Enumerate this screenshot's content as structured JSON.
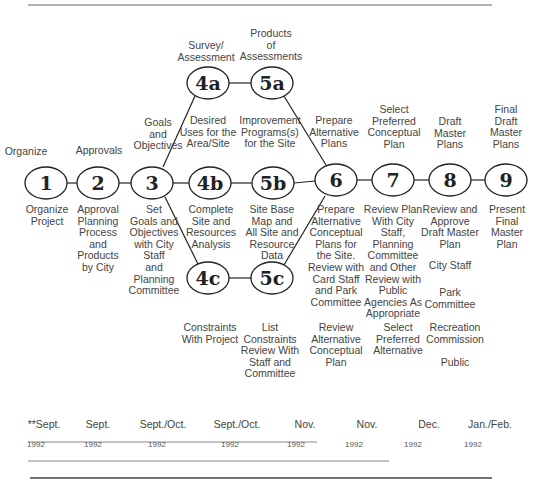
{
  "nodes": [
    {
      "id": "1",
      "x": 46,
      "y": 183
    },
    {
      "id": "2",
      "x": 98,
      "y": 183
    },
    {
      "id": "3",
      "x": 152,
      "y": 183
    },
    {
      "id": "4a",
      "x": 208,
      "y": 83
    },
    {
      "id": "4b",
      "x": 210,
      "y": 183
    },
    {
      "id": "4c",
      "x": 208,
      "y": 278
    },
    {
      "id": "5a",
      "x": 272,
      "y": 83
    },
    {
      "id": "5b",
      "x": 273,
      "y": 183
    },
    {
      "id": "5c",
      "x": 272,
      "y": 278
    },
    {
      "id": "6",
      "x": 336,
      "y": 180
    },
    {
      "id": "7",
      "x": 393,
      "y": 180
    },
    {
      "id": "8",
      "x": 450,
      "y": 180
    },
    {
      "id": "9",
      "x": 506,
      "y": 180
    }
  ],
  "labels_above": {
    "n1": "Organize",
    "n2": "Approvals",
    "n3": "Goals\nand\nObjectives",
    "n4a": "Survey/\nAssessment",
    "n5a": "Products\nof\nAssessments",
    "n4b": "Desired\nUses for the\nArea/Site",
    "n5b": "Improvement\nPrograms(s)\nfor the Site",
    "n6": "Prepare\nAlternative\nPlans",
    "n7": "Select\nPreferred\nConceptual\nPlan",
    "n8": "Draft\nMaster\nPlans",
    "n9": "Final\nDraft\nMaster\nPlans"
  },
  "labels_below": {
    "n1": "Organize\nProject",
    "n2": "Approval\nPlanning\nProcess\nand\nProducts\nby City",
    "n3": "Set\nGoals and\nObjectives\nwith City\nStaff\nand\nPlanning\nCommittee",
    "n4b": "Complete\nSite and\nResources\nAnalysis",
    "n5b": "Site Base\nMap and\nAll Site and\nResource\nData",
    "n6": "Prepare\nAlternative\nConceptual\nPlans for\nthe Site.\nReview with\nCard Staff\nand Park\nCommittee",
    "n7": "Review Plan\nWith City\nStaff,\nPlanning\nCommittee\nand Other\nReview with\nPublic\nAgencies As\nAppropriate",
    "n8": "Review and\nApprove\nDraft Master\nPlan",
    "n8_city_staff": "City Staff",
    "n8_park_committee": "Park\nCommittee",
    "n9": "Present\nFinal\nMaster\nPlan"
  },
  "labels_bottom": {
    "n4c": "Constraints\nWith Project",
    "n5c": "List\nConstraints\nReview With\nStaff and\nCommittee",
    "n6": "Review\nAlternative\nConceptual\nPlan",
    "n7": "Select\nPreferred\nAlternative",
    "n8_recreation": "Recreation\nCommission",
    "n8_public": "Public"
  },
  "timeline": {
    "months": [
      "**Sept.",
      "Sept.",
      "Sept./Oct.",
      "Sept./Oct.",
      "Nov.",
      "Nov.",
      "Dec.",
      "Jan./Feb."
    ],
    "years": [
      "1992",
      "1992",
      "1992",
      "1992",
      "1992",
      "1992",
      "1992",
      "1992"
    ]
  },
  "colors": {
    "line": "#222222",
    "rule": "#555555",
    "text": "#444444"
  }
}
